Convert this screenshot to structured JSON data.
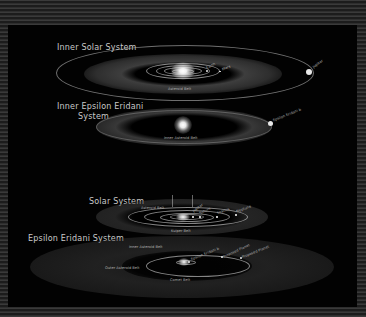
{
  "diagram": {
    "inner_solar": {
      "title": "Inner Solar System",
      "belt_label": "Asteroid Belt",
      "planets": [
        "Earth",
        "Mars"
      ],
      "outer_planet": "Jupiter"
    },
    "inner_eps": {
      "title_line1": "Inner Epsilon Eridani",
      "title_line2": "System",
      "belt_label": "Inner Asteroid Belt",
      "planet": "Epsilon Eridani b"
    },
    "solar": {
      "title": "Solar System",
      "belt_label": "Asteroid Belt",
      "kuiper_label": "Kuiper Belt",
      "planets": [
        "Jupiter",
        "Saturn",
        "Uranus",
        "Neptune"
      ]
    },
    "eps": {
      "title": "Epsilon Eridani System",
      "inner_belt_label": "Inner Asteroid Belt",
      "outer_belt_label": "Outer Asteroid Belt",
      "comet_label": "Comet Belt",
      "planets": [
        "Epsilon Eridani b",
        "Proposed Planet",
        "Proposed Planet"
      ]
    }
  },
  "colors": {
    "background": "#020202",
    "border_stripe": "#2e2e2e",
    "label": "#c8c8c8"
  }
}
